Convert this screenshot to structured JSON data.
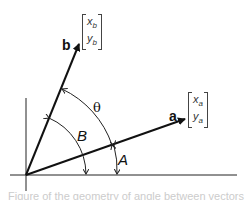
{
  "diagram": {
    "vector_a": {
      "label": "a",
      "x_comp": "x",
      "x_sub": "a",
      "y_comp": "y",
      "y_sub": "a"
    },
    "vector_b": {
      "label": "b",
      "x_comp": "x",
      "x_sub": "b",
      "y_comp": "y",
      "y_sub": "b"
    },
    "angles": {
      "theta": "θ",
      "B": "B",
      "A": "A"
    },
    "caption_partial": "Figure of the geometry of angle between vectors"
  }
}
